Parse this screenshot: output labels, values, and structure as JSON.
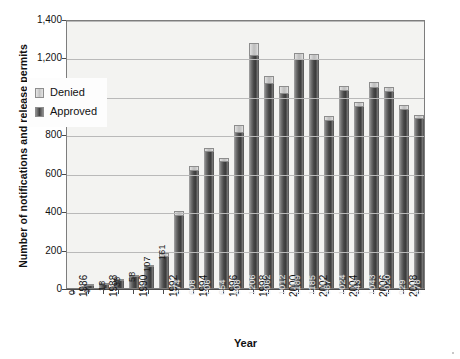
{
  "chart_data": {
    "type": "bar",
    "title": "",
    "xlabel": "Year",
    "ylabel": "Number of notifications and release permits",
    "ylim": [
      0,
      1400
    ],
    "ytick_step": 200,
    "ytick_labels": [
      "0",
      "200",
      "400",
      "600",
      "800",
      "1,000",
      "1,200",
      "1,400"
    ],
    "grid": true,
    "stacked": true,
    "legend_position": "inside-upper-left",
    "categories": [
      "1986",
      "1987",
      "1988",
      "1989",
      "1990",
      "1991",
      "1992",
      "1993",
      "1994",
      "1995",
      "1996",
      "1997",
      "1998",
      "1999",
      "2000",
      "2001",
      "2002",
      "2003",
      "2004",
      "2005",
      "2006",
      "2007",
      "2008",
      "2009"
    ],
    "xtick_labels_shown": [
      "1986",
      "1988",
      "1990",
      "1992",
      "1994",
      "1996",
      "1998",
      "2000",
      "2002",
      "2004",
      "2006",
      "2008"
    ],
    "series": [
      {
        "name": "Approved",
        "color": "#474747",
        "values": [
          0,
          9,
          18,
          38,
          58,
          107,
          161,
          374,
          608,
          706,
          654,
          808,
          1206,
          1062,
          1012,
          1189,
          1185,
          867,
          1024,
          943,
          1043,
          1020,
          929,
          878
        ]
      },
      {
        "name": "Denied",
        "color": "#c9c9c9",
        "values": [
          0,
          2,
          3,
          6,
          9,
          14,
          20,
          28,
          26,
          24,
          22,
          40,
          70,
          44,
          40,
          34,
          34,
          26,
          30,
          26,
          30,
          28,
          24,
          22
        ]
      }
    ],
    "bar_labels": [
      "0",
      "9",
      "18",
      "38",
      "58",
      "107",
      "161",
      "374",
      "608",
      "706",
      "654",
      "808",
      "1206",
      "1062",
      "1012",
      "1189",
      "1185",
      "867",
      "1024",
      "943",
      "1043",
      "1020",
      "929",
      "878"
    ]
  },
  "legend": {
    "items": [
      {
        "label": "Denied"
      },
      {
        "label": "Approved"
      }
    ]
  },
  "axes": {
    "y_title": "Number of notifications and release permits",
    "x_title": "Year"
  }
}
